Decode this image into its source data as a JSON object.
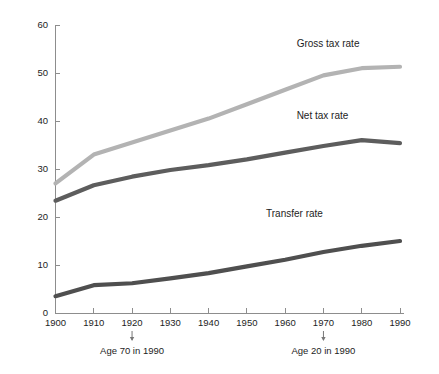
{
  "chart_data": {
    "type": "line",
    "title": "",
    "subtitle": "",
    "xlabel": "",
    "ylabel": "",
    "x": [
      1900,
      1910,
      1920,
      1930,
      1940,
      1950,
      1960,
      1970,
      1980,
      1990
    ],
    "xlim": [
      1900,
      1990
    ],
    "ylim": [
      0,
      60
    ],
    "xticks": [
      "1900",
      "1910",
      "1920",
      "1930",
      "1940",
      "1950",
      "1960",
      "1970",
      "1980",
      "1990"
    ],
    "yticks": [
      "0",
      "10",
      "20",
      "30",
      "40",
      "50",
      "60"
    ],
    "grid": false,
    "legend_position": "inline-right",
    "series": [
      {
        "name": "Gross tax rate",
        "color": "#b3b3b3",
        "label_x": 1963,
        "label_y": 55.5,
        "values": [
          27.0,
          33.0,
          35.5,
          38.0,
          40.5,
          43.5,
          46.5,
          49.5,
          51.0,
          51.3
        ]
      },
      {
        "name": "Net tax rate",
        "color": "#5d5d5d",
        "label_x": 1963,
        "label_y": 40.5,
        "values": [
          23.4,
          26.6,
          28.4,
          29.8,
          30.8,
          32.0,
          33.4,
          34.8,
          36.0,
          35.4
        ]
      },
      {
        "name": "Transfer rate",
        "color": "#4f4f4f",
        "label_x": 1955,
        "label_y": 20.0,
        "values": [
          3.5,
          5.8,
          6.2,
          7.2,
          8.3,
          9.7,
          11.1,
          12.7,
          14.0,
          15.0
        ]
      }
    ],
    "annotations": [
      {
        "text": "Age 70 in 1990",
        "x": 1920
      },
      {
        "text": "Age 20 in 1990",
        "x": 1970
      }
    ]
  },
  "colors": {
    "background": "#ffffff",
    "axis": "#8d8d8d",
    "text": "#1d1d1d",
    "gross": "#b3b3b3",
    "net": "#5d5d5d",
    "transfer": "#4f4f4f"
  }
}
